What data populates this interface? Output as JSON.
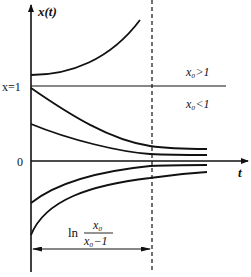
{
  "axes": {
    "y_label": "x(t)",
    "x_label": "t",
    "origin_label": "0",
    "fixed_point_label": "x=1"
  },
  "regions": {
    "above": "x₀>1",
    "below": "x₀<1"
  },
  "annotation": {
    "label_prefix": "ln",
    "numerator": "x₀",
    "denominator": "x₀−1"
  },
  "colors": {
    "ink": "#111111",
    "background": "#ffffff"
  }
}
